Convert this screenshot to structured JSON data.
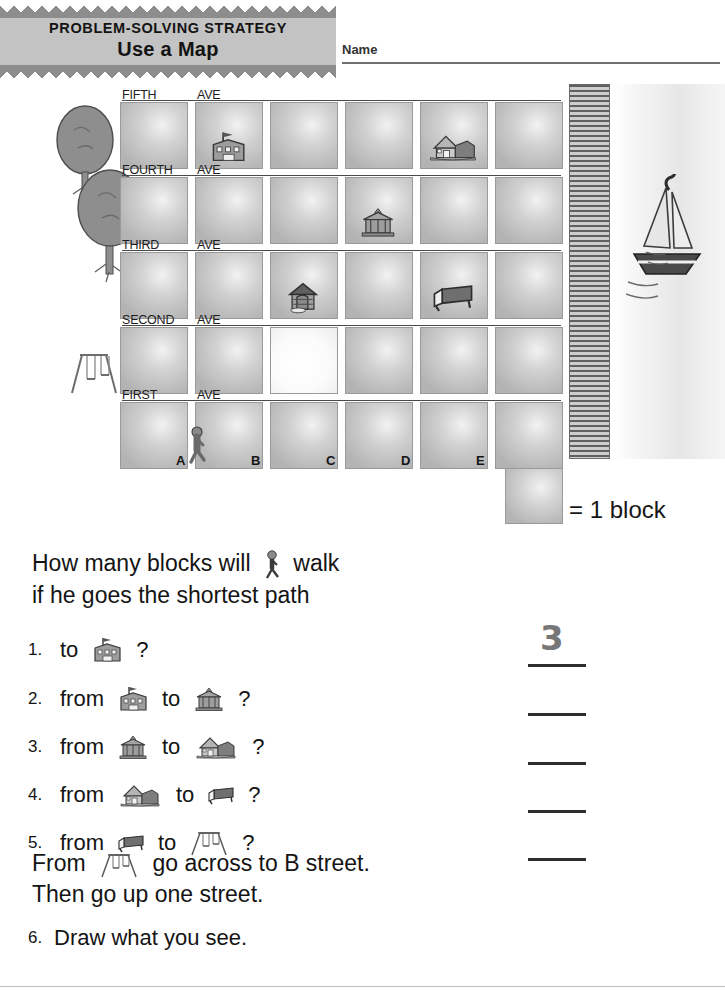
{
  "header": {
    "strategy_label": "PROBLEM-SOLVING STRATEGY",
    "title": "Use a Map",
    "name_label": "Name"
  },
  "map": {
    "street_rows": [
      "FIFTH",
      "FOURTH",
      "THIRD",
      "SECOND",
      "FIRST"
    ],
    "avenue_word": "AVE",
    "column_labels": [
      "A",
      "B",
      "C",
      "D",
      "E"
    ],
    "icons": {
      "school": "school-icon",
      "library": "library-icon",
      "hut": "hut-icon",
      "house": "house-icon",
      "bench": "bench-icon",
      "swing": "swing-set-icon",
      "boy": "boy-walking-icon",
      "tree": "tree-icon",
      "sailboat": "sailboat-icon",
      "dock": "dock-icon"
    },
    "placements": [
      {
        "name": "school-icon",
        "row": "FIFTH",
        "col": "B"
      },
      {
        "name": "house-icon",
        "row": "FIFTH",
        "col": "E"
      },
      {
        "name": "library-icon",
        "row": "FOURTH",
        "col": "D"
      },
      {
        "name": "hut-icon",
        "row": "THIRD",
        "col": "C"
      },
      {
        "name": "bench-icon",
        "row": "THIRD",
        "col": "E"
      },
      {
        "name": "boy-walking-icon",
        "row": "FIRST",
        "col": "A"
      },
      {
        "name": "swing-set-icon",
        "row": "SECOND",
        "col": "left-of-A"
      }
    ]
  },
  "legend": {
    "equals_text": "= 1 block"
  },
  "prompt": {
    "line1_before": "How many blocks will",
    "line1_after": "walk",
    "line2": "if he goes the shortest path"
  },
  "questions": [
    {
      "num": "1.",
      "words": [
        "to"
      ],
      "icons": [
        "school-icon"
      ],
      "end": "?",
      "answer": "3"
    },
    {
      "num": "2.",
      "words": [
        "from",
        "to"
      ],
      "icons": [
        "school-icon",
        "library-icon"
      ],
      "end": "?",
      "answer": ""
    },
    {
      "num": "3.",
      "words": [
        "from",
        "to"
      ],
      "icons": [
        "library-icon",
        "house-icon"
      ],
      "end": "?",
      "answer": ""
    },
    {
      "num": "4.",
      "words": [
        "from",
        "to"
      ],
      "icons": [
        "house-icon",
        "bench-icon"
      ],
      "end": "?",
      "answer": ""
    },
    {
      "num": "5.",
      "words": [
        "from",
        "to"
      ],
      "icons": [
        "bench-icon",
        "swing-set-icon"
      ],
      "end": "?",
      "answer": ""
    }
  ],
  "closing": {
    "line1_before": "From",
    "line1_after": "go across to B street.",
    "line2": "Then go up one street."
  },
  "question6": {
    "num": "6.",
    "text": "Draw what you see."
  },
  "colors": {
    "banner_bg": "#c3c3c3",
    "zigzag": "#8d8d8d",
    "cell_border": "#9a9a9a",
    "ink": "#141414",
    "rule": "#2e2e2e"
  }
}
